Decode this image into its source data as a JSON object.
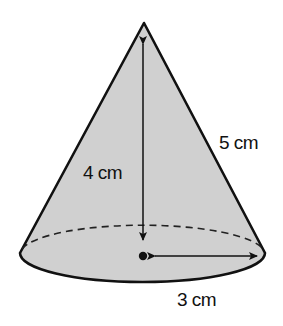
{
  "figure": {
    "shape": "cone",
    "colors": {
      "fill": "#d0d0d0",
      "stroke": "#111111",
      "background": "#ffffff"
    },
    "labels": {
      "slant_height": "5 cm",
      "height": "4 cm",
      "radius": "3 cm"
    },
    "measurements": {
      "slant_height_cm": 5,
      "height_cm": 4,
      "radius_cm": 3
    }
  }
}
